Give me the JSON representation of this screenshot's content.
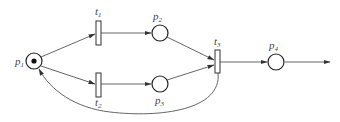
{
  "diagram": {
    "type": "petri-net",
    "places": [
      {
        "id": "p1",
        "label": "p",
        "sub": "1",
        "tokens": 1
      },
      {
        "id": "p2",
        "label": "p",
        "sub": "2",
        "tokens": 0
      },
      {
        "id": "p3",
        "label": "p",
        "sub": "3",
        "tokens": 0
      },
      {
        "id": "p4",
        "label": "p",
        "sub": "4",
        "tokens": 0
      }
    ],
    "transitions": [
      {
        "id": "t1",
        "label": "t",
        "sub": "1"
      },
      {
        "id": "t2",
        "label": "t",
        "sub": "2"
      },
      {
        "id": "t3",
        "label": "t",
        "sub": "3"
      }
    ],
    "arcs": [
      {
        "from": "p1",
        "to": "t1"
      },
      {
        "from": "p1",
        "to": "t2"
      },
      {
        "from": "t1",
        "to": "p2"
      },
      {
        "from": "t2",
        "to": "p3"
      },
      {
        "from": "p2",
        "to": "t3"
      },
      {
        "from": "p3",
        "to": "t3"
      },
      {
        "from": "t3",
        "to": "p4"
      },
      {
        "from": "t3",
        "to": "p1",
        "curved": true
      },
      {
        "from": "p4",
        "to": "output"
      }
    ]
  }
}
